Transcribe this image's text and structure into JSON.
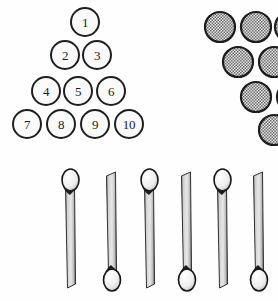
{
  "figure": {
    "background_color": "#fefefe",
    "width": 278,
    "height": 301,
    "panels": [
      {
        "id": "numbered-circles",
        "name": "Numbered circle triangle"
      },
      {
        "id": "gray-circles",
        "name": "Shaded circle cluster"
      },
      {
        "id": "matchsticks",
        "name": "Matchstick row"
      }
    ]
  },
  "numbered_circles": {
    "name": "numbered-circle-group",
    "fill_color": "#fafafa",
    "stroke_color": "#1f1f1f",
    "radius": 14,
    "rows": [
      {
        "row": 1,
        "items": [
          {
            "label": "1",
            "cx": 85,
            "cy": 22
          }
        ]
      },
      {
        "row": 2,
        "items": [
          {
            "label": "2",
            "cx": 65,
            "cy": 55
          },
          {
            "label": "3",
            "cx": 97,
            "cy": 55
          }
        ]
      },
      {
        "row": 3,
        "items": [
          {
            "label": "4",
            "cx": 46,
            "cy": 91
          },
          {
            "label": "5",
            "cx": 78,
            "cy": 91
          },
          {
            "label": "6",
            "cx": 111,
            "cy": 91
          }
        ]
      },
      {
        "row": 4,
        "items": [
          {
            "label": "7",
            "cx": 27,
            "cy": 124
          },
          {
            "label": "8",
            "cx": 61,
            "cy": 124
          },
          {
            "label": "9",
            "cx": 95,
            "cy": 124
          },
          {
            "label": "10",
            "cx": 129,
            "cy": 124
          }
        ]
      }
    ]
  },
  "gray_circles": {
    "name": "shaded-circle-group",
    "fill_color": "#c9c9c9",
    "stroke_color": "#1f1f1f",
    "radius": 15,
    "note": "cluster extends past the right edge of the image",
    "items": [
      {
        "cx": 220,
        "cy": 27
      },
      {
        "cx": 256,
        "cy": 27
      },
      {
        "cx": 290,
        "cy": 27
      },
      {
        "cx": 238,
        "cy": 62
      },
      {
        "cx": 274,
        "cy": 62
      },
      {
        "cx": 256,
        "cy": 97
      },
      {
        "cx": 292,
        "cy": 97
      },
      {
        "cx": 274,
        "cy": 130
      }
    ]
  },
  "matchsticks": {
    "name": "matchstick-group",
    "shaft_fill": "#d2d2d2",
    "shaft_edge": "#3a3a3a",
    "head_fill": "#f2f2f2",
    "head_stroke": "#161616",
    "count": 6,
    "items": [
      {
        "index": 1,
        "x": 70,
        "head": "top",
        "orientation": "head-up"
      },
      {
        "index": 2,
        "x": 111,
        "head": "bottom",
        "orientation": "head-down"
      },
      {
        "index": 3,
        "x": 149,
        "head": "top",
        "orientation": "head-up"
      },
      {
        "index": 4,
        "x": 186,
        "head": "bottom",
        "orientation": "head-down"
      },
      {
        "index": 5,
        "x": 222,
        "head": "top",
        "orientation": "head-up"
      },
      {
        "index": 6,
        "x": 258,
        "head": "bottom",
        "orientation": "head-down"
      }
    ],
    "shaft_top": 172,
    "shaft_bottom": 288
  }
}
